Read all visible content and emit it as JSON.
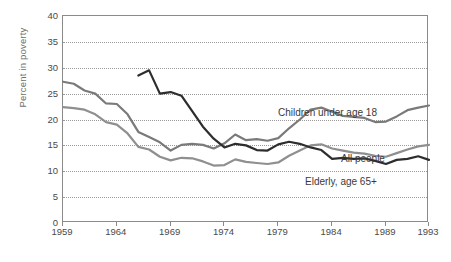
{
  "chart_data": {
    "type": "line",
    "title": "",
    "xlabel": "",
    "ylabel": "Percent in poverty",
    "xlim": [
      1959,
      1993
    ],
    "ylim": [
      0,
      40
    ],
    "grid": true,
    "legend_position": "inline-annotations",
    "x_ticks": [
      "1959",
      "1964",
      "1969",
      "1974",
      "1979",
      "1984",
      "1989",
      "1993"
    ],
    "x_tick_values": [
      1959,
      1964,
      1969,
      1974,
      1979,
      1984,
      1989,
      1993
    ],
    "y_ticks": [
      "0",
      "5",
      "10",
      "15",
      "20",
      "25",
      "30",
      "35",
      "40"
    ],
    "y_tick_values": [
      0,
      5,
      10,
      15,
      20,
      25,
      30,
      35,
      40
    ],
    "series": [
      {
        "name": "Children under age 18",
        "color": "#7a7a7a",
        "x": [
          1959,
          1960,
          1961,
          1962,
          1963,
          1964,
          1965,
          1966,
          1967,
          1968,
          1969,
          1970,
          1971,
          1972,
          1973,
          1974,
          1975,
          1976,
          1977,
          1978,
          1979,
          1980,
          1981,
          1982,
          1983,
          1984,
          1985,
          1986,
          1987,
          1988,
          1989,
          1990,
          1991,
          1992,
          1993
        ],
        "values": [
          27.3,
          26.9,
          25.6,
          25.0,
          23.1,
          23.0,
          21.0,
          17.6,
          16.6,
          15.6,
          14.0,
          15.1,
          15.3,
          15.1,
          14.4,
          15.4,
          17.1,
          16.0,
          16.2,
          15.9,
          16.4,
          18.3,
          20.0,
          21.9,
          22.3,
          21.5,
          20.7,
          20.5,
          20.3,
          19.5,
          19.6,
          20.6,
          21.8,
          22.3,
          22.7
        ]
      },
      {
        "name": "All people",
        "color": "#8f8f8f",
        "x": [
          1959,
          1960,
          1961,
          1962,
          1963,
          1964,
          1965,
          1966,
          1967,
          1968,
          1969,
          1970,
          1971,
          1972,
          1973,
          1974,
          1975,
          1976,
          1977,
          1978,
          1979,
          1980,
          1981,
          1982,
          1983,
          1984,
          1985,
          1986,
          1987,
          1988,
          1989,
          1990,
          1991,
          1992,
          1993
        ],
        "values": [
          22.4,
          22.2,
          21.9,
          21.0,
          19.5,
          19.0,
          17.3,
          14.7,
          14.2,
          12.8,
          12.1,
          12.6,
          12.5,
          11.9,
          11.1,
          11.2,
          12.3,
          11.8,
          11.6,
          11.4,
          11.7,
          13.0,
          14.0,
          15.0,
          15.2,
          14.4,
          14.0,
          13.6,
          13.4,
          13.0,
          12.8,
          13.5,
          14.2,
          14.8,
          15.1
        ]
      },
      {
        "name": "Elderly, age 65+",
        "color": "#2d2d2d",
        "x": [
          1966,
          1967,
          1968,
          1969,
          1970,
          1971,
          1972,
          1973,
          1974,
          1975,
          1976,
          1977,
          1978,
          1979,
          1980,
          1981,
          1982,
          1983,
          1984,
          1985,
          1986,
          1987,
          1988,
          1989,
          1990,
          1991,
          1992,
          1993
        ],
        "values": [
          28.5,
          29.5,
          25.0,
          25.3,
          24.6,
          21.6,
          18.6,
          16.3,
          14.6,
          15.3,
          15.0,
          14.1,
          14.0,
          15.2,
          15.7,
          15.3,
          14.6,
          14.1,
          12.4,
          12.6,
          12.4,
          12.5,
          12.0,
          11.4,
          12.2,
          12.4,
          12.9,
          12.2
        ]
      }
    ]
  }
}
